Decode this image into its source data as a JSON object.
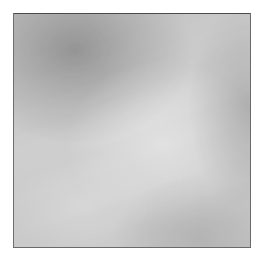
{
  "figure": {
    "kind": "histopathology-micrograph",
    "modality": "brightfield light microscopy",
    "staining": "grayscale (monochrome rendition)",
    "caption": "",
    "title": "",
    "label": "",
    "scale_bar_text": "",
    "magnification_text": "",
    "annotation_text": ""
  },
  "canvas": {
    "width_px": 263,
    "height_px": 261,
    "background_color": "#ffffff",
    "margin_px": 13
  },
  "plate": {
    "left_px": 13,
    "top_px": 13,
    "width_px": 238,
    "height_px": 235,
    "border_color": "#4a4a4a",
    "border_width_px": 1
  },
  "appearance": {
    "base_tone_color": "#c2c2c2",
    "nuclei_color": "#2b2b2b",
    "stroma_color": "#d4d4d4",
    "highlight_color": "#f2f2f2",
    "shadow_color": "#787878",
    "texture_description": "dense, diffusely distributed small dark nuclei over a lighter fibrillar stromal background",
    "regions": [
      {
        "name": "dense-band-upper-left",
        "description": "darker, hypercellular band in the upper-left quadrant",
        "relative_x": 0.26,
        "relative_y": 0.16,
        "tone": "dark"
      },
      {
        "name": "pale-zone-center",
        "description": "paler, less cellular zone through the centre and mid-right",
        "relative_x": 0.63,
        "relative_y": 0.56,
        "tone": "light"
      },
      {
        "name": "pale-zone-lower",
        "description": "paler patch in the lower-left of the field",
        "relative_x": 0.3,
        "relative_y": 0.82,
        "tone": "light"
      },
      {
        "name": "dense-band-right",
        "description": "darker cellular aggregation along the right margin and lower-right",
        "relative_x": 0.95,
        "relative_y": 0.45,
        "tone": "dark"
      }
    ]
  },
  "noise_seeds": {
    "modulation": 7,
    "fibers": 21,
    "speckle_coarse": 3,
    "speckle_fine": 88,
    "clearings": 45
  }
}
